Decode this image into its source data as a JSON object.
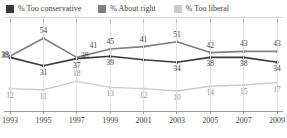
{
  "legend": {
    "items": [
      {
        "label": "% Too conservative",
        "color": "#3a3a3a",
        "icon": "square-swatch-icon"
      },
      {
        "label": "% About right",
        "color": "#808080",
        "icon": "square-swatch-icon"
      },
      {
        "label": "% Too liberal",
        "color": "#cccccc",
        "icon": "square-swatch-icon"
      }
    ]
  },
  "axis": {
    "x_ticks": [
      "1993",
      "1995",
      "1997",
      "1999",
      "2001",
      "2003",
      "2005",
      "2007",
      "2009"
    ]
  },
  "chart_data": {
    "type": "line",
    "title": "",
    "subtitle": "",
    "xlabel": "",
    "ylabel": "",
    "x": [
      1993,
      1995,
      1997,
      1999,
      2001,
      2003,
      2005,
      2007,
      2009
    ],
    "categories": [
      "1993",
      "1995",
      "1997",
      "1999",
      "2001",
      "2003",
      "2005",
      "2007",
      "2009"
    ],
    "ylim": [
      0,
      60
    ],
    "grid": true,
    "legend_position": "top",
    "series": [
      {
        "name": "% Too conservative",
        "color": "#3a3a3a",
        "values": [
          38,
          31,
          37,
          39,
          36,
          34,
          38,
          38,
          34
        ],
        "labels": [
          "38",
          "31",
          "37",
          "39",
          "",
          "34",
          "38",
          "38",
          "34"
        ],
        "label_positions": [
          "left",
          "below",
          "below",
          "below",
          "",
          "below",
          "below",
          "below",
          "below"
        ]
      },
      {
        "name": "% About right",
        "color": "#808080",
        "values": [
          39,
          54,
          38,
          45,
          47,
          51,
          42,
          43,
          43
        ],
        "labels": [
          "39",
          "54",
          "38",
          "45",
          "41",
          "51",
          "42",
          "43",
          "43"
        ],
        "label_positions": [
          "left",
          "above",
          "right",
          "above",
          "above",
          "above",
          "above",
          "above",
          "above"
        ]
      },
      {
        "name": "% Too liberal",
        "color": "#cccccc",
        "values": [
          12,
          11,
          18,
          13,
          12,
          10,
          14,
          15,
          17
        ],
        "labels": [
          "12",
          "11",
          "18",
          "13",
          "12",
          "10",
          "14",
          "15",
          "17"
        ],
        "label_positions": [
          "below",
          "below",
          "above",
          "below",
          "below",
          "below",
          "below",
          "below",
          "below"
        ]
      }
    ],
    "annotations": [
      {
        "text": "41",
        "series": "% About right",
        "note": "mid-point label between 1997 and 1999"
      }
    ]
  }
}
